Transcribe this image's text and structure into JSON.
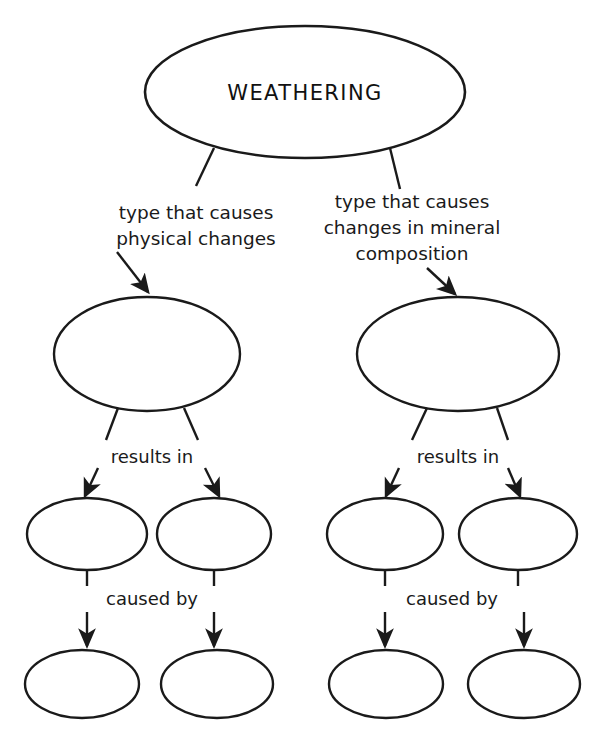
{
  "diagram": {
    "type": "concept-map",
    "background_color": "#ffffff",
    "line_color": "#1a1a1a",
    "text_color": "#111111",
    "root_node": {
      "id": "weathering",
      "label": "WEATHERING",
      "shape": "ellipse",
      "cx": 305,
      "cy": 92,
      "rx": 160,
      "ry": 66,
      "filled": false
    },
    "branch_labels": {
      "left": {
        "line1": "type that causes",
        "line2": "physical changes"
      },
      "right": {
        "line1": "type that causes",
        "line2": "changes in mineral",
        "line3": "composition"
      }
    },
    "tier2_nodes": [
      {
        "id": "left-type",
        "label": "",
        "shape": "ellipse",
        "cx": 147,
        "cy": 354,
        "rx": 93,
        "ry": 57,
        "filled": false
      },
      {
        "id": "right-type",
        "label": "",
        "shape": "ellipse",
        "cx": 458,
        "cy": 354,
        "rx": 101,
        "ry": 57,
        "filled": false
      }
    ],
    "tier2_link_labels": {
      "left": "results in",
      "right": "results in"
    },
    "tier3_nodes": [
      {
        "id": "left-result-1",
        "label": "",
        "shape": "ellipse",
        "cx": 87,
        "cy": 534,
        "rx": 60,
        "ry": 36,
        "filled": false
      },
      {
        "id": "left-result-2",
        "label": "",
        "shape": "ellipse",
        "cx": 214,
        "cy": 534,
        "rx": 57,
        "ry": 36,
        "filled": false
      },
      {
        "id": "right-result-1",
        "label": "",
        "shape": "ellipse",
        "cx": 385,
        "cy": 534,
        "rx": 58,
        "ry": 36,
        "filled": false
      },
      {
        "id": "right-result-2",
        "label": "",
        "shape": "ellipse",
        "cx": 518,
        "cy": 534,
        "rx": 59,
        "ry": 36,
        "filled": false
      }
    ],
    "tier3_link_labels": {
      "left": "caused by",
      "right": "caused by"
    },
    "tier4_nodes": [
      {
        "id": "left-cause-1",
        "label": "",
        "shape": "ellipse",
        "cx": 82,
        "cy": 684,
        "rx": 57,
        "ry": 34,
        "filled": false
      },
      {
        "id": "left-cause-2",
        "label": "",
        "shape": "ellipse",
        "cx": 217,
        "cy": 684,
        "rx": 56,
        "ry": 34,
        "filled": false
      },
      {
        "id": "right-cause-1",
        "label": "",
        "shape": "ellipse",
        "cx": 386,
        "cy": 684,
        "rx": 57,
        "ry": 34,
        "filled": false
      },
      {
        "id": "right-cause-2",
        "label": "",
        "shape": "ellipse",
        "cx": 524,
        "cy": 684,
        "rx": 56,
        "ry": 34,
        "filled": false
      }
    ],
    "notes": {
      "empty_node_count": 10,
      "labelled_node_count": 1
    }
  }
}
